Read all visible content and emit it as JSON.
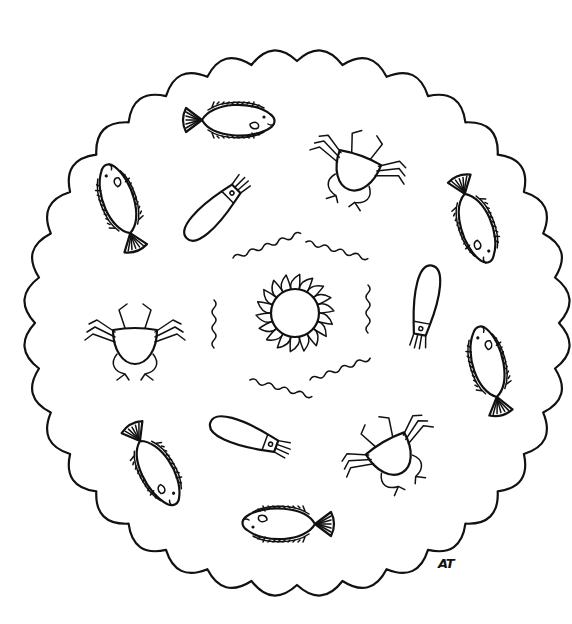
{
  "page": {
    "background": "#ffffff",
    "ink_color": "#111111"
  },
  "border": {
    "shape": "scalloped-circle",
    "center": [
      297,
      323
    ],
    "radius": 262,
    "scallops": 36
  },
  "center_motif": {
    "type": "sun",
    "center": [
      295,
      313
    ],
    "inner_radius": 24,
    "petals": 18
  },
  "waves": [
    {
      "x": 233,
      "y": 258,
      "w": 70,
      "angle": -20
    },
    {
      "x": 306,
      "y": 242,
      "w": 62,
      "angle": 15
    },
    {
      "x": 214,
      "y": 300,
      "w": 44,
      "angle": 90
    },
    {
      "x": 368,
      "y": 285,
      "w": 50,
      "angle": 90
    },
    {
      "x": 250,
      "y": 380,
      "w": 62,
      "angle": 15
    },
    {
      "x": 310,
      "y": 380,
      "w": 62,
      "angle": -20
    }
  ],
  "creatures": [
    {
      "type": "fish",
      "x": 232,
      "y": 120,
      "angle": 0,
      "scale": 1.0
    },
    {
      "type": "crab",
      "x": 357,
      "y": 167,
      "angle": 20,
      "scale": 1.0
    },
    {
      "type": "fish",
      "x": 475,
      "y": 222,
      "angle": 70,
      "scale": 1.0
    },
    {
      "type": "squid",
      "x": 215,
      "y": 210,
      "angle": -45,
      "scale": 1.0
    },
    {
      "type": "fish",
      "x": 120,
      "y": 205,
      "angle": -110,
      "scale": 1.0
    },
    {
      "type": "squid",
      "x": 425,
      "y": 305,
      "angle": 100,
      "scale": 1.0
    },
    {
      "type": "crab",
      "x": 135,
      "y": 340,
      "angle": 0,
      "scale": 1.0
    },
    {
      "type": "fish",
      "x": 489,
      "y": 368,
      "angle": -105,
      "scale": 1.0
    },
    {
      "type": "squid",
      "x": 248,
      "y": 436,
      "angle": 20,
      "scale": 1.0
    },
    {
      "type": "crab",
      "x": 390,
      "y": 452,
      "angle": -30,
      "scale": 1.0
    },
    {
      "type": "fish",
      "x": 155,
      "y": 467,
      "angle": 60,
      "scale": 1.0
    },
    {
      "type": "fish",
      "x": 285,
      "y": 524,
      "angle": 180,
      "scale": 1.0
    }
  ],
  "signature": {
    "text": "AT",
    "x": 438,
    "y": 556
  }
}
